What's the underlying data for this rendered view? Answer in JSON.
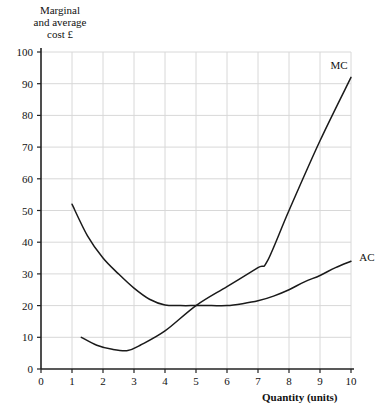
{
  "chart_data": {
    "type": "line",
    "title": "",
    "ylabel": "Marginal\nand average\ncost £",
    "ylabel_lines": [
      "Marginal",
      "and average",
      "cost £"
    ],
    "xlabel": "Quantity (units)",
    "xlim": [
      0,
      10
    ],
    "ylim": [
      0,
      100
    ],
    "xticks": [
      0,
      1,
      2,
      3,
      4,
      5,
      6,
      7,
      8,
      9,
      10
    ],
    "yticks": [
      0,
      10,
      20,
      30,
      40,
      50,
      60,
      70,
      80,
      90,
      100
    ],
    "grid": true,
    "legend_position": "inline-curve-labels",
    "line_color": "#1a1a1a",
    "grid_color": "#d8d8d8",
    "axis_color": "#222222",
    "background": "#ffffff",
    "series": [
      {
        "name": "MC",
        "label": "MC",
        "x": [
          1.3,
          1.8,
          2.3,
          2.8,
          3.2,
          4.0,
          5.0,
          6.0,
          7.0,
          7.3,
          8.0,
          9.0,
          10.0
        ],
        "values": [
          10,
          7.5,
          6.2,
          5.8,
          7.5,
          12,
          20,
          26,
          32,
          34,
          50,
          72,
          92
        ]
      },
      {
        "name": "AC",
        "label": "AC",
        "x": [
          1.0,
          1.5,
          2.0,
          2.5,
          3.0,
          3.5,
          4.0,
          4.5,
          5.0,
          5.5,
          6.0,
          6.5,
          7.0,
          7.5,
          8.0,
          8.5,
          9.0,
          9.5,
          10.0
        ],
        "values": [
          52,
          42,
          35,
          30,
          25.5,
          22,
          20.2,
          20,
          20,
          20,
          20,
          20.6,
          21.5,
          23,
          25,
          27.5,
          29.5,
          32,
          34
        ]
      }
    ],
    "annotations": [
      {
        "text": "MC",
        "x": 9.6,
        "y": 96
      },
      {
        "text": "AC",
        "x": 10.2,
        "y": 34
      }
    ]
  }
}
